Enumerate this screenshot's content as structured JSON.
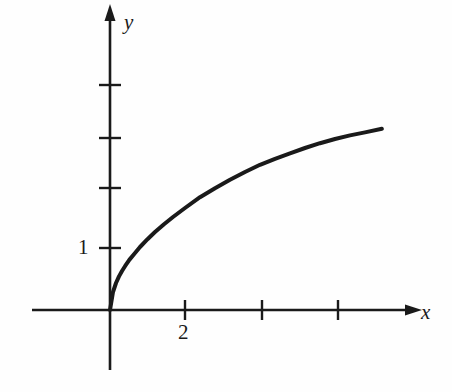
{
  "figure": {
    "background_color": "#fefefe",
    "ink_color": "#1a1a1a",
    "width": 452,
    "height": 392
  },
  "axes": {
    "x_axis_label": "x",
    "y_axis_label": "y",
    "x_axis_label_style": "italic",
    "y_axis_label_style": "italic",
    "origin_px": [
      110,
      310
    ],
    "x_unit_px": 37.5,
    "y_unit_px": 60,
    "x_axis_left_px": 32,
    "x_axis_arrow_px": 413,
    "y_axis_top_arrow_px": 13,
    "y_axis_bottom_px": 370
  },
  "ticks": {
    "x_tick_positions_px": [
      185,
      262,
      338
    ],
    "x_tick_values": [
      2,
      4,
      6
    ],
    "x_labeled": [
      {
        "value": "2",
        "px": 185
      }
    ],
    "y_tick_positions_px": [
      248,
      188,
      138,
      85
    ],
    "y_tick_values": [
      1,
      2,
      3,
      4
    ],
    "y_labeled": [
      {
        "value": "1",
        "px": 248
      }
    ]
  },
  "chart_data": {
    "type": "line",
    "title": "",
    "subtitle": "",
    "xlabel": "x",
    "ylabel": "y",
    "xlim": [
      -2.1,
      8.1
    ],
    "ylim": [
      -1.0,
      4.95
    ],
    "grid": false,
    "legend": null,
    "legend_position": "none",
    "annotations": [],
    "xticks": [
      2,
      4,
      6
    ],
    "xticklabels": [
      "2",
      "",
      ""
    ],
    "yticks": [
      1,
      2,
      3,
      4
    ],
    "yticklabels": [
      "1",
      "",
      "",
      ""
    ],
    "series": [
      {
        "name": "curve",
        "description": "increasing concave-down curve through the origin, square-root shaped",
        "color": "#1a1a1a",
        "linewidth": 4,
        "x": [
          0.0,
          0.08,
          0.16,
          0.24,
          0.32,
          0.4,
          0.52,
          0.64,
          0.8,
          1.0,
          1.2,
          1.44,
          1.68,
          2.0,
          2.4,
          2.8,
          3.2,
          3.6,
          4.0,
          4.4,
          4.8,
          5.2,
          5.6,
          6.0,
          6.4,
          6.8,
          7.25
        ],
        "y": [
          0.0,
          0.3,
          0.45,
          0.56,
          0.65,
          0.73,
          0.84,
          0.93,
          1.05,
          1.18,
          1.3,
          1.43,
          1.55,
          1.7,
          1.88,
          2.03,
          2.17,
          2.3,
          2.42,
          2.52,
          2.61,
          2.7,
          2.78,
          2.85,
          2.91,
          2.96,
          3.02
        ]
      }
    ]
  }
}
